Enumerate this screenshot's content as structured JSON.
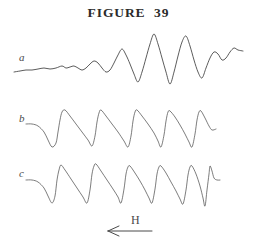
{
  "figure": {
    "title": "FIGURE  39",
    "background_color": "#ffffff",
    "ink_color": "#3a3a3a"
  },
  "traces": [
    {
      "id": "a",
      "label": "a"
    },
    {
      "id": "b",
      "label": "b"
    },
    {
      "id": "c",
      "label": "c"
    }
  ],
  "axis": {
    "label": "H",
    "arrow_direction": "left",
    "arrow_icon": "left-arrow-icon"
  },
  "chart_data": {
    "type": "line",
    "title": "FIGURE  39",
    "xlabel": "H",
    "ylabel": "",
    "grid": false,
    "legend": "none",
    "axis_direction_note": "H increases to the left (arrow points left)",
    "panels": [
      {
        "name": "a",
        "label": "a",
        "description": "Low-amplitude noisy baseline at left that grows into large oscillations peaking near the centre-right, then decays into a small wavy tail.",
        "baseline_y": 70,
        "x_range": [
          14,
          243
        ],
        "points": [
          [
            14,
            72
          ],
          [
            20,
            71
          ],
          [
            26,
            70
          ],
          [
            32,
            70
          ],
          [
            38,
            69
          ],
          [
            44,
            68
          ],
          [
            50,
            69
          ],
          [
            56,
            68
          ],
          [
            62,
            66
          ],
          [
            66,
            68
          ],
          [
            70,
            67
          ],
          [
            74,
            66
          ],
          [
            78,
            68
          ],
          [
            82,
            70
          ],
          [
            86,
            68
          ],
          [
            90,
            64
          ],
          [
            94,
            61
          ],
          [
            98,
            63
          ],
          [
            102,
            68
          ],
          [
            106,
            72
          ],
          [
            110,
            70
          ],
          [
            114,
            63
          ],
          [
            118,
            55
          ],
          [
            122,
            49
          ],
          [
            126,
            55
          ],
          [
            130,
            64
          ],
          [
            134,
            74
          ],
          [
            138,
            82
          ],
          [
            142,
            72
          ],
          [
            146,
            58
          ],
          [
            150,
            44
          ],
          [
            154,
            34
          ],
          [
            158,
            44
          ],
          [
            162,
            58
          ],
          [
            166,
            72
          ],
          [
            170,
            84
          ],
          [
            174,
            72
          ],
          [
            178,
            56
          ],
          [
            182,
            42
          ],
          [
            186,
            36
          ],
          [
            190,
            46
          ],
          [
            194,
            60
          ],
          [
            198,
            72
          ],
          [
            202,
            78
          ],
          [
            206,
            68
          ],
          [
            210,
            58
          ],
          [
            214,
            52
          ],
          [
            218,
            54
          ],
          [
            222,
            60
          ],
          [
            226,
            58
          ],
          [
            230,
            52
          ],
          [
            234,
            48
          ],
          [
            238,
            50
          ],
          [
            243,
            51
          ]
        ]
      },
      {
        "name": "b",
        "label": "b",
        "description": "Sawtooth-like oscillation of roughly eight cycles: rapid rise to a rounded peak followed by a gradual fall, preceded by a short descending lead-in and followed by a short flat tail.",
        "baseline_y": 128,
        "x_range": [
          26,
          216
        ],
        "cycles": 8,
        "points": [
          [
            26,
            124
          ],
          [
            32,
            124
          ],
          [
            38,
            126
          ],
          [
            44,
            132
          ],
          [
            48,
            140
          ],
          [
            52,
            147
          ],
          [
            56,
            143
          ],
          [
            58,
            132
          ],
          [
            60,
            120
          ],
          [
            62,
            112
          ],
          [
            65,
            110
          ],
          [
            70,
            116
          ],
          [
            76,
            124
          ],
          [
            82,
            132
          ],
          [
            88,
            140
          ],
          [
            92,
            146
          ],
          [
            95,
            136
          ],
          [
            97,
            122
          ],
          [
            99,
            113
          ],
          [
            101,
            110
          ],
          [
            106,
            116
          ],
          [
            112,
            124
          ],
          [
            118,
            132
          ],
          [
            124,
            141
          ],
          [
            128,
            147
          ],
          [
            131,
            136
          ],
          [
            133,
            121
          ],
          [
            135,
            112
          ],
          [
            137,
            110
          ],
          [
            142,
            116
          ],
          [
            148,
            124
          ],
          [
            154,
            133
          ],
          [
            158,
            141
          ],
          [
            161,
            147
          ],
          [
            164,
            135
          ],
          [
            166,
            121
          ],
          [
            168,
            112
          ],
          [
            170,
            111
          ],
          [
            175,
            117
          ],
          [
            180,
            125
          ],
          [
            185,
            134
          ],
          [
            189,
            142
          ],
          [
            192,
            147
          ],
          [
            195,
            134
          ],
          [
            197,
            120
          ],
          [
            199,
            112
          ],
          [
            201,
            111
          ],
          [
            205,
            118
          ],
          [
            209,
            126
          ],
          [
            212,
            130
          ],
          [
            216,
            129
          ]
        ]
      },
      {
        "name": "c",
        "label": "c",
        "description": "Similar sawtooth oscillation of roughly eight cycles with slightly larger amplitude, ending in a tall sharp spike that relaxes to a flat tail.",
        "baseline_y": 184,
        "x_range": [
          26,
          220
        ],
        "cycles": 8,
        "points": [
          [
            26,
            180
          ],
          [
            32,
            180
          ],
          [
            38,
            182
          ],
          [
            44,
            188
          ],
          [
            48,
            196
          ],
          [
            52,
            203
          ],
          [
            55,
            196
          ],
          [
            57,
            180
          ],
          [
            59,
            170
          ],
          [
            61,
            165
          ],
          [
            65,
            170
          ],
          [
            71,
            179
          ],
          [
            77,
            188
          ],
          [
            83,
            197
          ],
          [
            87,
            203
          ],
          [
            90,
            190
          ],
          [
            92,
            174
          ],
          [
            94,
            166
          ],
          [
            96,
            164
          ],
          [
            101,
            171
          ],
          [
            107,
            180
          ],
          [
            113,
            189
          ],
          [
            118,
            197
          ],
          [
            121,
            203
          ],
          [
            124,
            189
          ],
          [
            126,
            174
          ],
          [
            128,
            167
          ],
          [
            130,
            166
          ],
          [
            135,
            173
          ],
          [
            140,
            181
          ],
          [
            145,
            190
          ],
          [
            149,
            198
          ],
          [
            152,
            203
          ],
          [
            155,
            189
          ],
          [
            157,
            174
          ],
          [
            159,
            167
          ],
          [
            161,
            166
          ],
          [
            166,
            173
          ],
          [
            171,
            182
          ],
          [
            176,
            191
          ],
          [
            180,
            199
          ],
          [
            183,
            204
          ],
          [
            186,
            190
          ],
          [
            188,
            175
          ],
          [
            190,
            167
          ],
          [
            192,
            166
          ],
          [
            196,
            174
          ],
          [
            200,
            186
          ],
          [
            203,
            198
          ],
          [
            205,
            206
          ],
          [
            207,
            190
          ],
          [
            209,
            174
          ],
          [
            210,
            166
          ],
          [
            212,
            171
          ],
          [
            214,
            178
          ],
          [
            217,
            180
          ],
          [
            220,
            180
          ]
        ]
      }
    ]
  }
}
